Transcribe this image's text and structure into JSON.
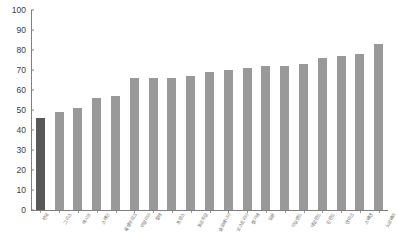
{
  "chart_data": {
    "type": "bar",
    "title": "",
    "xlabel": "",
    "ylabel": "",
    "ylim": [
      0,
      100
    ],
    "ytick_values": [
      100,
      90,
      80,
      70,
      60,
      50,
      40,
      30,
      20,
      10,
      0
    ],
    "ytick_labels": [
      "100",
      "90",
      "80",
      "70",
      "60",
      "50",
      "40",
      "30",
      "20",
      "10",
      "0"
    ],
    "grid": false,
    "legend": "none",
    "highlight_index": 0,
    "colors": {
      "bar": "#999999",
      "bar_highlight": "#595959",
      "axis": "#7f7f7f",
      "tick_text": "#404040",
      "label_text": "#6e6e6e",
      "background": "#ffffff"
    },
    "categories": [
      "한국",
      "그리스",
      "멕시코",
      "스페인",
      "룩셈부르크",
      "이탈리아",
      "칠레",
      "프랑스",
      "포르투갈",
      "슬로베니아",
      "오스트리아",
      "벨기에",
      "일본",
      "아일랜드",
      "네덜란드",
      "핀란드",
      "덴마크",
      "스웨덴",
      "노르웨이"
    ],
    "values": [
      46,
      49,
      51,
      56,
      57,
      66,
      66,
      66,
      67,
      69,
      70,
      71,
      72,
      72,
      73,
      76,
      77,
      78,
      83
    ]
  }
}
